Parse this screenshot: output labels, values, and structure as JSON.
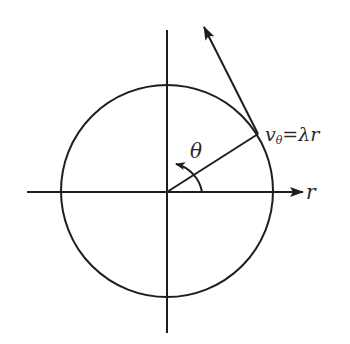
{
  "diagram": {
    "labels": {
      "theta": "θ",
      "r_axis": "r",
      "velocity_v": "v",
      "velocity_sub": "θ",
      "velocity_rhs": "=λr"
    },
    "colors": {
      "stroke": "#1e1e1e",
      "background": "#ffffff"
    }
  }
}
